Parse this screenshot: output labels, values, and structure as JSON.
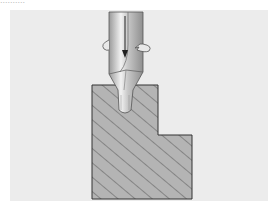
{
  "caption": "..........",
  "diagram": {
    "elements": [
      {
        "name": "drill-bit",
        "description": "Rotating twist drill with feed arrow"
      },
      {
        "name": "rotation-arrows",
        "description": "Curved arrows around drill shank indicating rotation"
      },
      {
        "name": "feed-arrow",
        "description": "Downward arrow indicating feed direction"
      },
      {
        "name": "workpiece",
        "description": "L-shaped hatched cross-section of workpiece"
      },
      {
        "name": "drilled-hole",
        "description": "Pilot hole in workpiece"
      }
    ],
    "colors": {
      "background": "#ececec",
      "workpiece_fill": "#b4b4b4",
      "hatch": "#555555",
      "outline": "#333333",
      "drill_light": "#f2f2f2",
      "drill_dark": "#9a9a9a"
    }
  }
}
